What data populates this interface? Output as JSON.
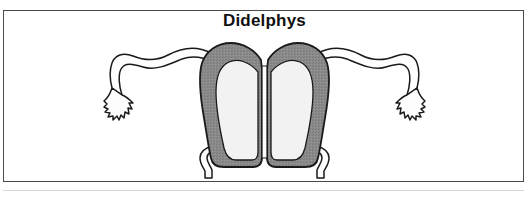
{
  "figure": {
    "title": "Didelphys",
    "caption_present": false,
    "background_color": "#ffffff",
    "frame_color": "#4a4a4a",
    "frame": {
      "x": 3,
      "y": 10,
      "width": 521,
      "height": 172
    }
  },
  "colors": {
    "myometrium_fill": "#8a8a8a",
    "myometrium_fill_light": "#9a9a9a",
    "cavity_fill": "#f2f2f2",
    "outline": "#1a1a1a",
    "tube_fill": "#fdfdfd",
    "title_color": "#111111",
    "scan_rule": "#d8d8d8"
  },
  "anatomy": {
    "label": "Uterus didelphys (double uterus, double cervix)",
    "parts": [
      {
        "name": "left-fallopian-tube",
        "side": "left",
        "description": "wavy double-lined oviduct curving laterally and downward"
      },
      {
        "name": "left-fimbriae",
        "side": "left",
        "description": "jagged finger-like projections at distal tube end"
      },
      {
        "name": "left-uterine-horn",
        "side": "left",
        "description": "separate gray myometrial horn with pale endometrial cavity"
      },
      {
        "name": "left-cervix",
        "side": "left",
        "description": "narrow descending cervical canal"
      },
      {
        "name": "right-uterine-horn",
        "side": "right",
        "description": "separate gray myometrial horn with pale endometrial cavity"
      },
      {
        "name": "right-cervix",
        "side": "right",
        "description": "narrow descending cervical canal"
      },
      {
        "name": "right-fallopian-tube",
        "side": "right",
        "description": "wavy double-lined oviduct curving laterally and downward"
      },
      {
        "name": "right-fimbriae",
        "side": "right",
        "description": "jagged finger-like projections at distal tube end"
      },
      {
        "name": "midline-cleft",
        "side": "center",
        "description": "deep separation between the two independent uterine bodies"
      }
    ]
  }
}
